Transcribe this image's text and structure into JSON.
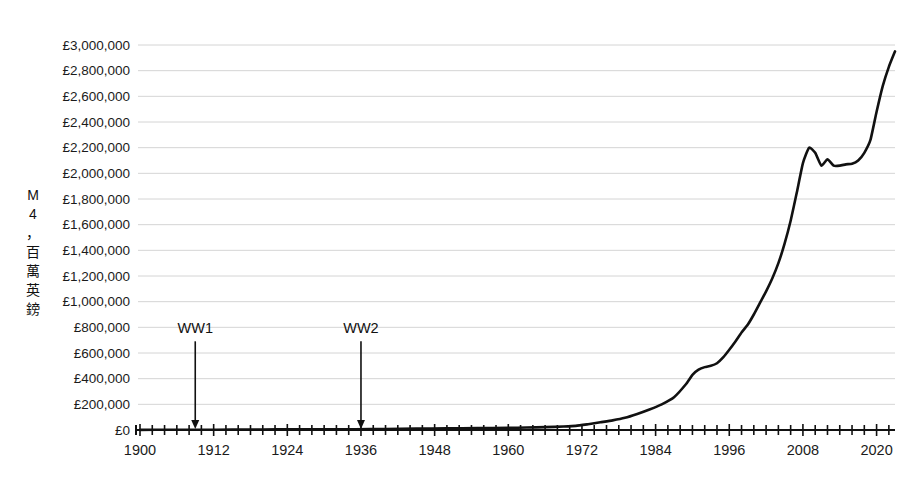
{
  "chart_data": {
    "type": "line",
    "title": "",
    "subtitle": "",
    "xlabel": "",
    "ylabel": "M4，百萬英鎊",
    "ylabel_chars": [
      "M",
      "4",
      "，",
      "百",
      "萬",
      "英",
      "鎊"
    ],
    "xlim": [
      1900,
      2023
    ],
    "ylim": [
      0,
      3000000
    ],
    "grid": "horizontal",
    "legend": "none",
    "series_color": "#111111",
    "grid_color": "#c9c9c9",
    "axis_color": "#111111",
    "background": "#ffffff",
    "y_ticks": [
      0,
      200000,
      400000,
      600000,
      800000,
      1000000,
      1200000,
      1400000,
      1600000,
      1800000,
      2000000,
      2200000,
      2400000,
      2600000,
      2800000,
      3000000
    ],
    "y_tick_labels": [
      "£0",
      "£200,000",
      "£400,000",
      "£600,000",
      "£800,000",
      "£1,000,000",
      "£1,200,000",
      "£1,400,000",
      "£1,600,000",
      "£1,800,000",
      "£2,000,000",
      "£2,200,000",
      "£2,400,000",
      "£2,600,000",
      "£2,800,000",
      "£3,000,000"
    ],
    "x_ticks_major": [
      1900,
      1912,
      1924,
      1936,
      1948,
      1960,
      1972,
      1984,
      1996,
      2008,
      2020
    ],
    "x_tick_labels": [
      "1900",
      "1912",
      "1924",
      "1936",
      "1948",
      "1960",
      "1972",
      "1984",
      "1996",
      "2008",
      "2020"
    ],
    "x_tick_minor_step": 2,
    "annotations": [
      {
        "label": "WW1",
        "x": 1909,
        "arrow_from_value": 660000,
        "arrow_to_value": 0
      },
      {
        "label": "WW2",
        "x": 1936,
        "arrow_from_value": 660000,
        "arrow_to_value": 0
      }
    ],
    "series": [
      {
        "name": "M4 money supply",
        "x": [
          1900,
          1905,
          1910,
          1915,
          1920,
          1925,
          1930,
          1935,
          1940,
          1945,
          1950,
          1955,
          1960,
          1963,
          1966,
          1969,
          1971,
          1973,
          1975,
          1977,
          1979,
          1981,
          1983,
          1985,
          1987,
          1989,
          1990,
          1991,
          1992,
          1993,
          1994,
          1995,
          1996,
          1997,
          1998,
          1999,
          2000,
          2001,
          2002,
          2003,
          2004,
          2005,
          2006,
          2007,
          2008,
          2009,
          2010,
          2011,
          2012,
          2013,
          2014,
          2015,
          2016,
          2017,
          2018,
          2019,
          2020,
          2021,
          2022,
          2023
        ],
        "values": [
          1200,
          1500,
          1900,
          2600,
          4200,
          4800,
          5200,
          6000,
          7500,
          10500,
          13000,
          14500,
          16500,
          19000,
          22500,
          27000,
          32000,
          45000,
          60000,
          75000,
          95000,
          125000,
          160000,
          200000,
          255000,
          360000,
          430000,
          470000,
          490000,
          500000,
          520000,
          565000,
          625000,
          690000,
          760000,
          820000,
          900000,
          990000,
          1080000,
          1180000,
          1300000,
          1450000,
          1630000,
          1850000,
          2080000,
          2200000,
          2160000,
          2060000,
          2110000,
          2060000,
          2060000,
          2070000,
          2075000,
          2100000,
          2160000,
          2260000,
          2480000,
          2680000,
          2830000,
          2950000
        ]
      }
    ]
  }
}
